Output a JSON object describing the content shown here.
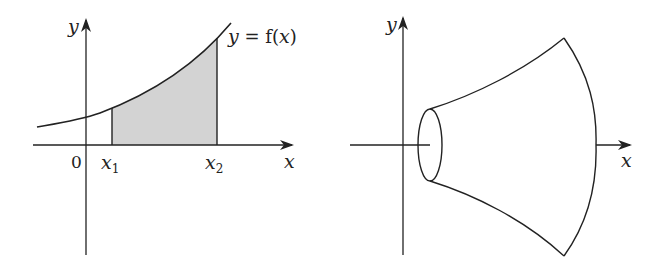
{
  "left_figure": {
    "y_axis_label": "y",
    "x_axis_label": "x",
    "origin_label": "0",
    "x1_label": "x",
    "x1_subscript": "1",
    "x2_label": "x",
    "x2_subscript": "2",
    "curve_label_y": "y",
    "curve_label_eq": " = f(",
    "curve_label_x": "x",
    "curve_label_close": ")",
    "shading_color": "#d3d3d3",
    "line_color": "#222222"
  },
  "right_figure": {
    "y_axis_label": "y",
    "x_axis_label": "x",
    "line_color": "#222222"
  }
}
